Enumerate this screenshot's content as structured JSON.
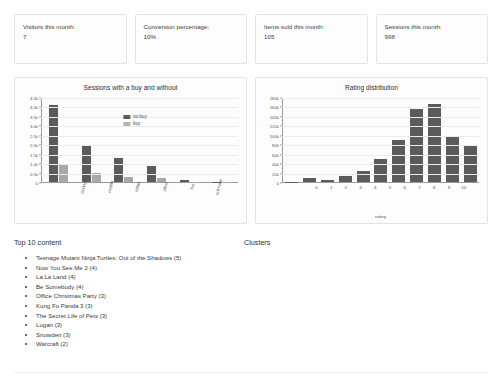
{
  "stats": [
    {
      "label": "Visitors this month:",
      "value": "7"
    },
    {
      "label": "Conversion percentage:",
      "value": "10%"
    },
    {
      "label": "Items sold this month:",
      "value": "105"
    },
    {
      "label": "Sessions this month:",
      "value": "998"
    }
  ],
  "sections": {
    "top_content_heading": "Top 10 content",
    "clusters_heading": "Clusters"
  },
  "top_content": [
    "Teenage Mutant Ninja Turtles: Out of the Shadows (5)",
    "Now You See Me 2 (4)",
    "La La Land (4)",
    "Be Somebody (4)",
    "Office Christmas Party (3)",
    "Kung Fu Panda 3 (3)",
    "The Secret Life of Pets (3)",
    "Logan (3)",
    "Snowden (3)",
    "Warcraft (2)"
  ],
  "colors": {
    "bar_no_buy": "#5b5b5b",
    "bar_buy": "#a8a8a8",
    "rating_bar": "#5b5b5b",
    "panel_border": "#e3e3e3",
    "grid": "#ececec"
  },
  "chart_data": [
    {
      "type": "bar",
      "title": "Sessions with a buy and without",
      "xlabel": "",
      "ylabel": "",
      "ylim": [
        0,
        4500
      ],
      "grid": true,
      "legend": [
        "no buy",
        "buy"
      ],
      "legend_position": "top-center",
      "categories": [
        "desktop",
        "mobile",
        "tablet",
        "other",
        "bot",
        "unknown"
      ],
      "ytick_labels": [
        "0",
        "0.5k",
        "1.0k",
        "1.5k",
        "2.0k",
        "2.5k",
        "3.0k",
        "3.5k",
        "4.0k",
        "4.5k"
      ],
      "ytick_values": [
        0,
        500,
        1000,
        1500,
        2000,
        2500,
        3000,
        3500,
        4000,
        4500
      ],
      "series": [
        {
          "name": "no buy",
          "values": [
            4100,
            2000,
            1300,
            850,
            110,
            25
          ]
        },
        {
          "name": "buy",
          "values": [
            950,
            500,
            250,
            200,
            15,
            5
          ]
        }
      ]
    },
    {
      "type": "bar",
      "title": "Rating distribution",
      "xlabel": "rating",
      "ylabel": "",
      "ylim": [
        0,
        180000
      ],
      "grid": true,
      "legend": [],
      "categories": [
        "0",
        "1",
        "2",
        "3",
        "4",
        "5",
        "6",
        "7",
        "8",
        "9",
        "10"
      ],
      "ytick_labels": [
        "0",
        "20k",
        "40k",
        "60k",
        "80k",
        "100k",
        "120k",
        "140k",
        "160k",
        "180k"
      ],
      "ytick_values": [
        0,
        20000,
        40000,
        60000,
        80000,
        100000,
        120000,
        140000,
        160000,
        180000
      ],
      "values": [
        1000,
        8000,
        5000,
        12000,
        23000,
        50000,
        89000,
        156000,
        168000,
        97000,
        79000
      ]
    }
  ]
}
